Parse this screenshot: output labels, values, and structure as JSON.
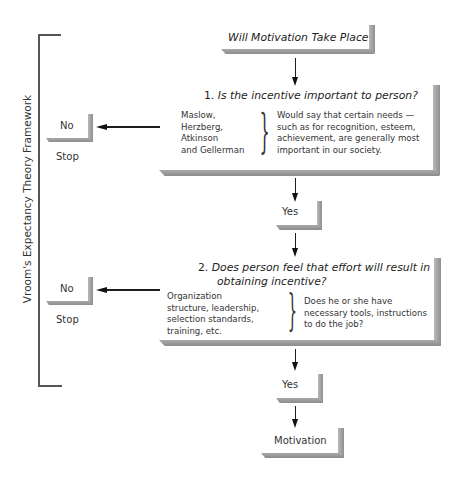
{
  "page_header_partial": "",
  "framework_label": "Vroom's Expectancy Theory Framework",
  "start": {
    "label": "Will Motivation Take Place?"
  },
  "question1": {
    "number": "1.",
    "title": "Is the incentive important to person?",
    "theorists": [
      "Maslow,",
      "Herzberg,",
      "Atkinson",
      "and Gellerman"
    ],
    "explanation": [
      "Would say that certain needs —",
      "such as for recognition, esteem,",
      "achievement, are generally most",
      "important in our society."
    ],
    "no_label": "No",
    "stop_label": "Stop",
    "yes_label": "Yes"
  },
  "question2": {
    "number": "2.",
    "title_line1": "Does person feel that effort will result in",
    "title_line2": "obtaining incentive?",
    "factors": [
      "Organization",
      "structure, leadership,",
      "selection standards,",
      "training, etc."
    ],
    "explanation": [
      "Does he or she have",
      "necessary tools, instructions",
      "to do the job?"
    ],
    "no_label": "No",
    "stop_label": "Stop",
    "yes_label": "Yes"
  },
  "outcome": {
    "label": "Motivation"
  },
  "colors": {
    "shade": "#999999",
    "line": "#1d1d1d",
    "text": "#2a2a2a"
  }
}
